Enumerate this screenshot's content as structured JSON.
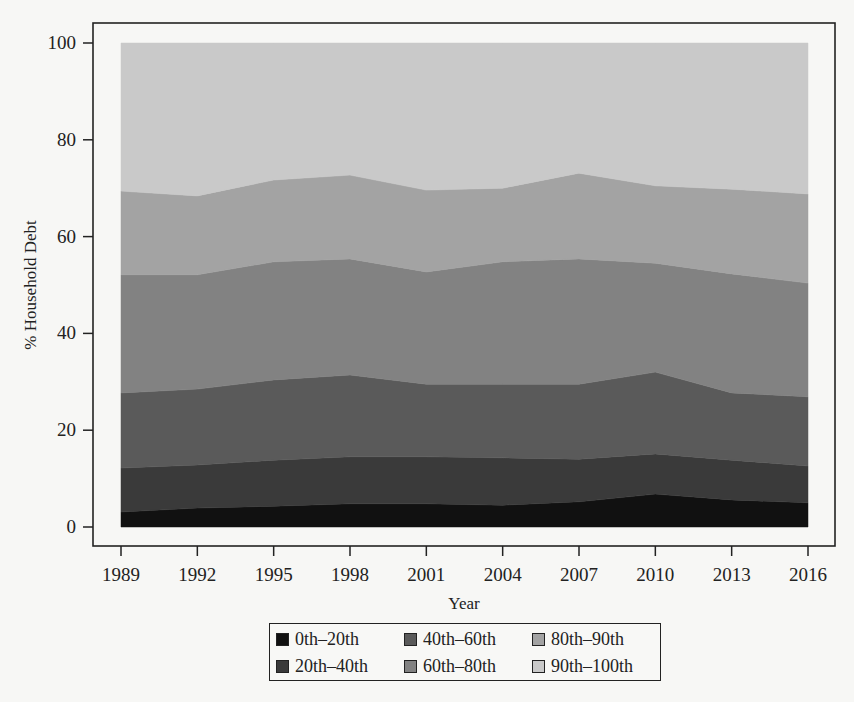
{
  "chart_data": {
    "type": "area",
    "stacked": true,
    "title": "",
    "xlabel": "Year",
    "ylabel": "% Household Debt",
    "x": [
      1989,
      1992,
      1995,
      1998,
      2001,
      2004,
      2007,
      2010,
      2013,
      2016
    ],
    "xticks": [
      "1989",
      "1992",
      "1995",
      "1998",
      "2001",
      "2004",
      "2007",
      "2010",
      "2013",
      "2016"
    ],
    "yticks": [
      "0",
      "20",
      "40",
      "60",
      "80",
      "100"
    ],
    "ylim": [
      0,
      100
    ],
    "grid": false,
    "legend_position": "bottom",
    "series": [
      {
        "name": "0th–20th",
        "color": "#111111",
        "values": [
          3.1,
          3.9,
          4.3,
          4.8,
          4.8,
          4.5,
          5.2,
          6.8,
          5.6,
          5.0
        ]
      },
      {
        "name": "20th–40th",
        "color": "#3a3a3a",
        "values": [
          9.1,
          8.9,
          9.5,
          9.7,
          9.7,
          9.8,
          8.8,
          8.3,
          8.2,
          7.6
        ]
      },
      {
        "name": "40th–60th",
        "color": "#5a5a5a",
        "values": [
          15.5,
          15.7,
          16.6,
          16.9,
          15.0,
          15.2,
          15.5,
          16.9,
          13.9,
          14.3
        ]
      },
      {
        "name": "60th–80th",
        "color": "#828282",
        "values": [
          24.4,
          23.6,
          24.4,
          24.0,
          23.2,
          25.3,
          25.9,
          22.5,
          24.6,
          23.5
        ]
      },
      {
        "name": "80th–90th",
        "color": "#a3a3a3",
        "values": [
          17.3,
          16.3,
          16.9,
          17.3,
          16.9,
          15.2,
          17.7,
          16.0,
          17.5,
          18.4
        ]
      },
      {
        "name": "90th–100th",
        "color": "#c9c9c9",
        "values": [
          30.6,
          31.6,
          28.3,
          27.3,
          30.4,
          30.0,
          26.9,
          29.5,
          30.2,
          31.2
        ]
      }
    ]
  },
  "legend": {
    "items": [
      {
        "label": "0th–20th",
        "color": "#111111"
      },
      {
        "label": "20th–40th",
        "color": "#3a3a3a"
      },
      {
        "label": "40th–60th",
        "color": "#5a5a5a"
      },
      {
        "label": "60th–80th",
        "color": "#828282"
      },
      {
        "label": "80th–90th",
        "color": "#a3a3a3"
      },
      {
        "label": "90th–100th",
        "color": "#c9c9c9"
      }
    ]
  }
}
